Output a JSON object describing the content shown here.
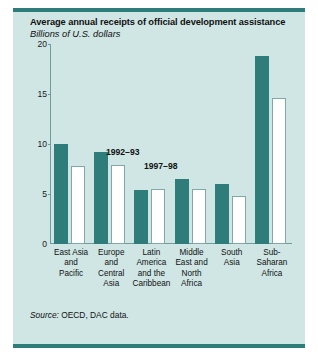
{
  "figure": {
    "title": "Average annual receipts of official development assistance",
    "subtitle": "Billions of U.S. dollars",
    "source_word": "Source:",
    "source_text": " OECD, DAC data."
  },
  "colors": {
    "panel_background": "#cfe6e4",
    "rule": "#2e7d7b",
    "series_1992_93": "#2e7d7b",
    "series_1997_98": "#ffffff",
    "axis": "#6f9c9b",
    "text": "#111111"
  },
  "chart_data": {
    "type": "bar",
    "title": "Average annual receipts of official development assistance",
    "subtitle": "Billions of U.S. dollars",
    "xlabel": "",
    "ylabel": "Billions of U.S. dollars",
    "ylim": [
      0,
      20
    ],
    "yticks": [
      0,
      5,
      10,
      15,
      20
    ],
    "ytick_labels": [
      "0",
      "5",
      "10",
      "15",
      "20"
    ],
    "grid": false,
    "legend_position": "inside-upper-left",
    "categories": [
      "East Asia and Pacific",
      "Europe and Central Asia",
      "Latin America and the Caribbean",
      "Middle East and North Africa",
      "South Asia",
      "Sub-Saharan Africa"
    ],
    "category_label_lines": [
      [
        "East Asia",
        "and",
        "Pacific"
      ],
      [
        "Europe",
        "and",
        "Central",
        "Asia"
      ],
      [
        "Latin",
        "America",
        "and the",
        "Caribbean"
      ],
      [
        "Middle",
        "East and",
        "North",
        "Africa"
      ],
      [
        "South",
        "Asia"
      ],
      [
        "Sub-",
        "Saharan",
        "Africa"
      ]
    ],
    "series": [
      {
        "name": "1992–93",
        "values": [
          10.0,
          9.2,
          5.4,
          6.5,
          6.0,
          18.8
        ]
      },
      {
        "name": "1997–98",
        "values": [
          7.8,
          7.9,
          5.5,
          5.5,
          4.8,
          14.6
        ]
      }
    ]
  }
}
